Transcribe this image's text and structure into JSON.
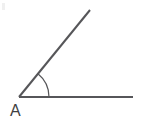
{
  "figure": {
    "kind": "geometry-angle-diagram",
    "background_color": "#ffffff",
    "width": 151,
    "height": 125,
    "stroke_color": "#565659",
    "label_color": "#3f3f42",
    "vertex_label": "A",
    "vertex": {
      "x": 19,
      "y": 97
    },
    "rays": [
      {
        "name": "horizontal-ray",
        "from": {
          "x": 19,
          "y": 97
        },
        "to": {
          "x": 133,
          "y": 97
        },
        "stroke_width": 2.2,
        "direction_degrees": 0
      },
      {
        "name": "diagonal-ray",
        "from": {
          "x": 19,
          "y": 97
        },
        "to": {
          "x": 90,
          "y": 10
        },
        "stroke_width": 2.0,
        "direction_degrees": 50.8
      }
    ],
    "angle_arc": {
      "name": "angle-arc",
      "center": {
        "x": 19,
        "y": 97
      },
      "radius": 30,
      "start_point": {
        "x": 38,
        "y": 74
      },
      "end_point": {
        "x": 49,
        "y": 97
      },
      "start_degrees": 0,
      "end_degrees": 50.8,
      "stroke_width": 1.2
    },
    "label_position": {
      "x": 10,
      "y": 116
    },
    "corner_artifact": {
      "visible": true,
      "color": "#f0f0f0"
    }
  }
}
